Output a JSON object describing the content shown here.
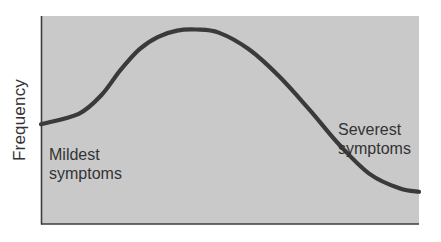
{
  "chart_data": {
    "type": "line",
    "title": "",
    "xlabel": "",
    "ylabel": "Frequency",
    "grid": false,
    "legend": null,
    "x_ticks": [],
    "y_ticks": [],
    "annotations": [
      {
        "text": "Mildest symptoms",
        "lines": [
          "Mildest",
          "symptoms"
        ],
        "position": "left, below curve start"
      },
      {
        "text": "Severest symptoms",
        "lines": [
          "Severest",
          "symptoms"
        ],
        "position": "right, above curve tail"
      }
    ],
    "series": [
      {
        "name": "Symptom severity distribution",
        "description": "Skewed bell-shaped frequency curve: moderate frequency at mildest symptoms, peak at mild-moderate severity, tapering toward severest symptoms",
        "x": [
          0,
          0.1,
          0.16,
          0.21,
          0.26,
          0.31,
          0.36,
          0.41,
          0.47,
          0.55,
          0.63,
          0.71,
          0.79,
          0.87,
          0.95,
          1.0
        ],
        "y": [
          0.48,
          0.53,
          0.62,
          0.74,
          0.84,
          0.9,
          0.93,
          0.935,
          0.92,
          0.84,
          0.71,
          0.55,
          0.38,
          0.24,
          0.17,
          0.155
        ]
      }
    ],
    "xlim": [
      0,
      1
    ],
    "ylim": [
      0,
      1
    ]
  },
  "labels": {
    "ylabel": "Frequency",
    "mild_line1": "Mildest",
    "mild_line2": "symptoms",
    "severe_line1": "Severest",
    "severe_line2": "symptoms"
  },
  "colors": {
    "plot_background": "#c9c9c9",
    "curve": "#3a3a3a",
    "axis": "#3c3c3c",
    "text": "#333333"
  }
}
